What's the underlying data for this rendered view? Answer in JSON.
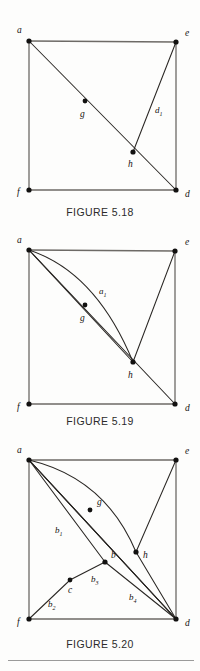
{
  "document": {
    "kind": "textbook-figure-column",
    "figures": [
      {
        "id": "fig-518",
        "caption": "FIGURE 5.18",
        "vertices": [
          {
            "name": "a",
            "label": "a",
            "x": 29,
            "y": 41,
            "label_x": 17,
            "label_y": 33
          },
          {
            "name": "e",
            "label": "e",
            "x": 176,
            "y": 42,
            "label_x": 185,
            "label_y": 36
          },
          {
            "name": "f",
            "label": "f",
            "x": 29,
            "y": 190,
            "label_x": 17,
            "label_y": 195
          },
          {
            "name": "d",
            "label": "d",
            "x": 176,
            "y": 190,
            "label_x": 185,
            "label_y": 197
          },
          {
            "name": "g",
            "label": "g",
            "x": 85,
            "y": 101,
            "label_x": 80,
            "label_y": 117
          },
          {
            "name": "h",
            "label": "h",
            "x": 133,
            "y": 152,
            "label_x": 128,
            "label_y": 167
          }
        ],
        "edge_labels": [
          {
            "name": "d1",
            "base": "d",
            "sub": "1",
            "x": 155,
            "y": 113
          }
        ]
      },
      {
        "id": "fig-519",
        "caption": "FIGURE 5.19",
        "vertices": [
          {
            "name": "a",
            "label": "a",
            "x": 29,
            "y": 250,
            "label_x": 17,
            "label_y": 243
          },
          {
            "name": "e",
            "label": "e",
            "x": 175,
            "y": 251,
            "label_x": 185,
            "label_y": 245
          },
          {
            "name": "f",
            "label": "f",
            "x": 29,
            "y": 404,
            "label_x": 17,
            "label_y": 410
          },
          {
            "name": "d",
            "label": "d",
            "x": 175,
            "y": 404,
            "label_x": 185,
            "label_y": 411
          },
          {
            "name": "g",
            "label": "g",
            "x": 85,
            "y": 305,
            "label_x": 80,
            "label_y": 321
          },
          {
            "name": "h",
            "label": "h",
            "x": 133,
            "y": 362,
            "label_x": 128,
            "label_y": 378
          }
        ],
        "edge_labels": [
          {
            "name": "a1",
            "base": "a",
            "sub": "1",
            "x": 99,
            "y": 294
          }
        ]
      },
      {
        "id": "fig-520",
        "caption": "FIGURE 5.20",
        "vertices": [
          {
            "name": "a",
            "label": "a",
            "x": 29,
            "y": 460,
            "label_x": 17,
            "label_y": 453
          },
          {
            "name": "e",
            "label": "e",
            "x": 176,
            "y": 460,
            "label_x": 185,
            "label_y": 454
          },
          {
            "name": "f",
            "label": "f",
            "x": 29,
            "y": 619,
            "label_x": 17,
            "label_y": 625
          },
          {
            "name": "d",
            "label": "d",
            "x": 176,
            "y": 619,
            "label_x": 185,
            "label_y": 626
          },
          {
            "name": "g",
            "label": "g",
            "x": 90,
            "y": 510,
            "label_x": 97,
            "label_y": 505
          },
          {
            "name": "h",
            "label": "h",
            "x": 136,
            "y": 552,
            "label_x": 143,
            "label_y": 558
          },
          {
            "name": "b",
            "label": "b",
            "x": 105,
            "y": 562,
            "label_x": 111,
            "label_y": 558
          },
          {
            "name": "c",
            "label": "c",
            "x": 70,
            "y": 580,
            "label_x": 68,
            "label_y": 593
          }
        ],
        "edge_labels": [
          {
            "name": "b1",
            "base": "b",
            "sub": "1",
            "x": 55,
            "y": 533
          },
          {
            "name": "b2",
            "base": "b",
            "sub": "2",
            "x": 48,
            "y": 607
          },
          {
            "name": "b3",
            "base": "b",
            "sub": "3",
            "x": 91,
            "y": 582
          },
          {
            "name": "b4",
            "base": "b",
            "sub": "4",
            "x": 129,
            "y": 600
          }
        ]
      }
    ]
  },
  "colors": {
    "ink": "#2a2724",
    "frame": "#6d6a66",
    "caption": "#2b2b2b",
    "page": "#fdfdfc",
    "rule": "#9a9a9a"
  }
}
